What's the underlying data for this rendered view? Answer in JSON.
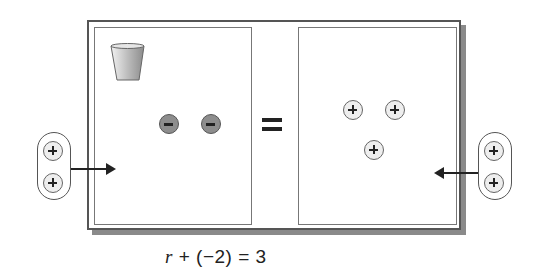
{
  "figure": {
    "left_panel": {
      "cup": "cup-icon",
      "counters": [
        {
          "type": "negative",
          "symbol": "−"
        },
        {
          "type": "negative",
          "symbol": "−"
        }
      ]
    },
    "equals_sign": "=",
    "right_panel": {
      "counters": [
        {
          "type": "positive",
          "symbol": "+"
        },
        {
          "type": "positive",
          "symbol": "+"
        },
        {
          "type": "positive",
          "symbol": "+"
        }
      ]
    },
    "left_added_group": {
      "counters": [
        "+",
        "+"
      ],
      "arrow_direction": "right"
    },
    "right_added_group": {
      "counters": [
        "+",
        "+"
      ],
      "arrow_direction": "left"
    },
    "equation": {
      "variable": "r",
      "rest": " + (−2) = 3"
    }
  }
}
